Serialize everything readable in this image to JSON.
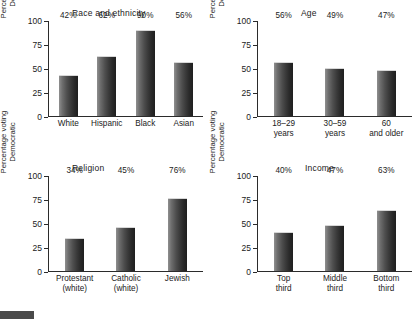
{
  "figure": {
    "shared_ylabel": "Percentage voting\nDemocratic",
    "yticks": [
      "0",
      "25",
      "50",
      "75",
      "100"
    ]
  },
  "footer": {
    "caption": ""
  },
  "chart_data": [
    {
      "type": "bar",
      "title": "Race and ethnicity",
      "xlabel": "",
      "ylabel": "Percentage voting Democratic",
      "ylim": [
        0,
        100
      ],
      "yticks": [
        0,
        25,
        50,
        75,
        100
      ],
      "grid": false,
      "legend": "none",
      "categories": [
        "White",
        "Hispanic",
        "Black",
        "Asian"
      ],
      "values": [
        42,
        62,
        90,
        56
      ],
      "data_labels": [
        "42%",
        "62%",
        "90%",
        "56%"
      ]
    },
    {
      "type": "bar",
      "title": "Age",
      "xlabel": "",
      "ylabel": "Percentage voting Democratic",
      "ylim": [
        0,
        100
      ],
      "yticks": [
        0,
        25,
        50,
        75,
        100
      ],
      "grid": false,
      "legend": "none",
      "categories": [
        "18–29\nyears",
        "30–59\nyears",
        "60\nand older"
      ],
      "values": [
        56,
        49,
        47
      ],
      "data_labels": [
        "56%",
        "49%",
        "47%"
      ]
    },
    {
      "type": "bar",
      "title": "Religion",
      "xlabel": "",
      "ylabel": "Percentage voting Democratic",
      "ylim": [
        0,
        100
      ],
      "yticks": [
        0,
        25,
        50,
        75,
        100
      ],
      "grid": false,
      "legend": "none",
      "categories": [
        "Protestant\n(white)",
        "Catholic\n(white)",
        "Jewish"
      ],
      "values": [
        34,
        45,
        76
      ],
      "data_labels": [
        "34%",
        "45%",
        "76%"
      ]
    },
    {
      "type": "bar",
      "title": "Income",
      "xlabel": "",
      "ylabel": "Percentage voting Democratic",
      "ylim": [
        0,
        100
      ],
      "yticks": [
        0,
        25,
        50,
        75,
        100
      ],
      "grid": false,
      "legend": "none",
      "categories": [
        "Top\nthird",
        "Middle\nthird",
        "Bottom\nthird"
      ],
      "values": [
        40,
        47,
        63
      ],
      "data_labels": [
        "40%",
        "47%",
        "63%"
      ]
    }
  ]
}
